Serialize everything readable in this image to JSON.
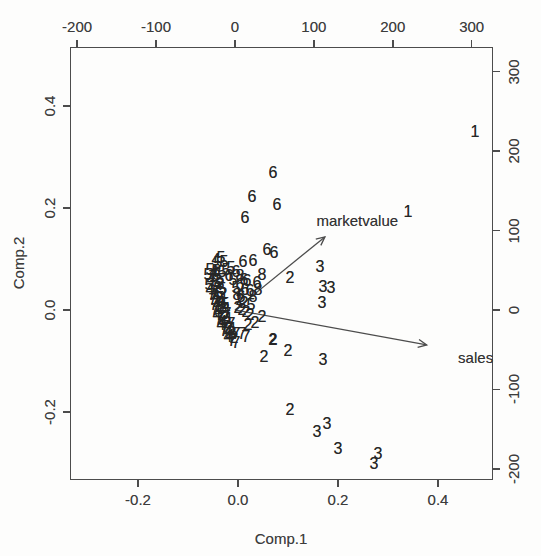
{
  "figure": {
    "background": "#fdfdfc",
    "ink": "#4c4c4c",
    "text_ink": "#3c3c3c"
  },
  "chart_data": {
    "type": "scatter",
    "subtype": "pca-biplot",
    "title": "",
    "xlabel": "Comp.1",
    "ylabel": "Comp.2",
    "grid": false,
    "xlim": [
      -0.336,
      0.51
    ],
    "ylim": [
      -0.333,
      0.515
    ],
    "x_ticks": [
      -0.2,
      0.0,
      0.2,
      0.4
    ],
    "x_tick_labels": [
      "-0.2",
      "0.0",
      "0.2",
      "0.4"
    ],
    "y_ticks": [
      -0.2,
      0.0,
      0.2,
      0.4
    ],
    "y_tick_labels": [
      "-0.2",
      "0.0",
      "0.2",
      "0.4"
    ],
    "xlim2": [
      -209,
      327
    ],
    "ylim2": [
      -214,
      331
    ],
    "top_ticks": [
      -200,
      -100,
      0,
      100,
      200,
      300
    ],
    "top_tick_labels": [
      "-200",
      "-100",
      "0",
      "100",
      "200",
      "300"
    ],
    "right_ticks": [
      -200,
      -100,
      0,
      100,
      200,
      300
    ],
    "right_tick_labels": [
      "-200",
      "-100",
      "0",
      "100",
      "200",
      "300"
    ],
    "arrows": [
      {
        "label": "marketvalue",
        "from": [
          0,
          0
        ],
        "tip": [
          114,
          92
        ],
        "label_pos": [
          155,
          113
        ]
      },
      {
        "label": "sales",
        "from": [
          0,
          0
        ],
        "tip": [
          243,
          -44
        ],
        "label_pos": [
          305,
          -59
        ]
      }
    ],
    "points": [
      [
        "1",
        0.474,
        0.348
      ],
      [
        "1",
        0.34,
        0.192
      ],
      [
        "6",
        0.07,
        0.268
      ],
      [
        "6",
        0.028,
        0.221
      ],
      [
        "6",
        0.078,
        0.205
      ],
      [
        "6",
        0.014,
        0.18
      ],
      [
        "6",
        0.058,
        0.117
      ],
      [
        "6",
        0.072,
        0.112
      ],
      [
        "6",
        0.01,
        0.094
      ],
      [
        "6",
        0.03,
        0.096
      ],
      [
        "3",
        0.164,
        0.084
      ],
      [
        "2",
        0.104,
        0.063
      ],
      [
        "3",
        0.17,
        0.045
      ],
      [
        "3",
        0.186,
        0.043
      ],
      [
        "3",
        0.168,
        0.014
      ],
      [
        "2",
        0.07,
        -0.059,
        1
      ],
      [
        "2",
        0.1,
        -0.08
      ],
      [
        "2",
        0.052,
        -0.092
      ],
      [
        "3",
        0.17,
        -0.098
      ],
      [
        "2",
        0.104,
        -0.196
      ],
      [
        "3",
        0.178,
        -0.223
      ],
      [
        "3",
        0.158,
        -0.239
      ],
      [
        "3",
        0.2,
        -0.272
      ],
      [
        "3",
        0.28,
        -0.282
      ],
      [
        "3",
        0.272,
        -0.301
      ],
      [
        "6",
        0.018,
        0.057
      ],
      [
        "8",
        0.048,
        0.068
      ],
      [
        "6",
        0.038,
        0.053
      ],
      [
        "8",
        0.04,
        0.039
      ],
      [
        "5",
        -0.04,
        0.092
      ],
      [
        "5",
        -0.028,
        0.094
      ],
      [
        "5",
        -0.044,
        0.076
      ],
      [
        "5",
        -0.032,
        0.074
      ],
      [
        "5",
        -0.036,
        0.059
      ],
      [
        "5",
        -0.034,
        0.102
      ],
      [
        "4",
        -0.044,
        0.098
      ],
      [
        "2",
        0.048,
        -0.014
      ],
      [
        "2",
        0.034,
        -0.025
      ],
      [
        "2",
        0.02,
        -0.029
      ],
      [
        "7",
        0.008,
        -0.047
      ],
      [
        "7",
        0.016,
        -0.053
      ],
      [
        "7",
        -0.012,
        -0.061
      ],
      [
        "7",
        -0.004,
        -0.065
      ],
      [
        "4",
        -0.02,
        -0.053
      ],
      [
        "5",
        0.026,
        0.01
      ],
      [
        "8",
        0.03,
        0.025
      ],
      [
        "6",
        0.024,
        0.037
      ],
      [
        "5",
        -0.024,
        0.078
      ],
      [
        "5",
        -0.014,
        0.082
      ],
      [
        "5",
        -0.01,
        0.059
      ],
      [
        "6",
        -0.018,
        0.067
      ],
      [
        "6",
        -0.004,
        0.074
      ],
      [
        "5",
        -0.004,
        0.043
      ],
      [
        "6",
        0.004,
        0.049
      ],
      [
        "6",
        0.014,
        0.039
      ],
      [
        "6",
        0.006,
        0.025
      ],
      [
        "8",
        -0.002,
        0.029
      ],
      [
        "8",
        0.004,
        0.067
      ],
      [
        "6",
        0.012,
        0.059
      ],
      [
        "2",
        0.004,
        0.02
      ],
      [
        "2",
        0.012,
        0.014
      ],
      [
        "2",
        0.0,
        0.004
      ],
      [
        "2",
        0.008,
        0.0
      ],
      [
        "2",
        0.016,
        -0.004
      ],
      [
        "2",
        0.024,
        -0.01
      ],
      [
        "5",
        -0.056,
        0.078
      ],
      [
        "4",
        -0.048,
        0.074
      ],
      [
        "5",
        -0.06,
        0.068
      ],
      [
        "7",
        -0.05,
        0.065
      ],
      [
        "5",
        -0.042,
        0.068
      ],
      [
        "4",
        -0.054,
        0.059
      ],
      [
        "5",
        -0.044,
        0.055
      ],
      [
        "3",
        -0.036,
        0.051
      ],
      [
        "5",
        -0.058,
        0.049
      ],
      [
        "7",
        -0.048,
        0.045
      ],
      [
        "2",
        -0.04,
        0.043
      ],
      [
        "5",
        -0.032,
        0.041
      ],
      [
        "4",
        -0.056,
        0.039
      ],
      [
        "7",
        -0.046,
        0.035
      ],
      [
        "5",
        -0.038,
        0.033
      ],
      [
        "2",
        -0.03,
        0.031
      ],
      [
        "7",
        -0.052,
        0.029
      ],
      [
        "4",
        -0.044,
        0.025
      ],
      [
        "5",
        -0.036,
        0.023
      ],
      [
        "1",
        -0.028,
        0.022
      ],
      [
        "7",
        -0.05,
        0.02
      ],
      [
        "2",
        -0.042,
        0.016
      ],
      [
        "4",
        -0.034,
        0.014
      ],
      [
        "5",
        -0.026,
        0.012
      ],
      [
        "7",
        -0.048,
        0.01
      ],
      [
        "1",
        -0.04,
        0.006
      ],
      [
        "2",
        -0.032,
        0.004
      ],
      [
        "4",
        -0.024,
        0.002
      ],
      [
        "7",
        -0.046,
        0.0
      ],
      [
        "5",
        -0.038,
        -0.004
      ],
      [
        "2",
        -0.03,
        -0.006
      ],
      [
        "7",
        -0.022,
        -0.008
      ],
      [
        "4",
        -0.042,
        -0.01
      ],
      [
        "7",
        -0.034,
        -0.014
      ],
      [
        "2",
        -0.026,
        -0.016
      ],
      [
        "1",
        -0.018,
        -0.018
      ],
      [
        "7",
        -0.038,
        -0.02
      ],
      [
        "4",
        -0.03,
        -0.023
      ],
      [
        "2",
        -0.022,
        -0.025
      ],
      [
        "7",
        -0.014,
        -0.027
      ],
      [
        "4",
        -0.034,
        -0.029
      ],
      [
        "7",
        -0.026,
        -0.033
      ],
      [
        "2",
        -0.018,
        -0.035
      ],
      [
        "1",
        -0.01,
        -0.037
      ],
      [
        "7",
        -0.028,
        -0.041
      ],
      [
        "4",
        -0.02,
        -0.043
      ],
      [
        "2",
        -0.012,
        -0.045
      ],
      [
        "7",
        -0.004,
        -0.047
      ],
      [
        "4",
        -0.016,
        -0.051
      ],
      [
        "2",
        -0.008,
        -0.055
      ]
    ]
  }
}
